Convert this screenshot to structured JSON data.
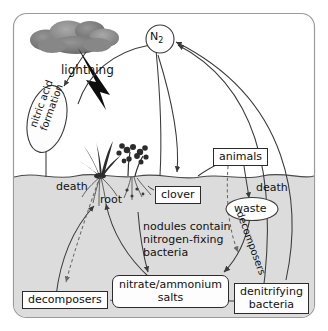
{
  "diagram": {
    "colors": {
      "ink": "#111111",
      "line": "#3a3a3a",
      "soil": "#dcdcdc",
      "cloud_dark": "#6e6e6e",
      "cloud_light": "#9a9a9a",
      "lightning": "#0d0d0d",
      "plant": "#2c2c2c",
      "frame": "#9a9a9a",
      "box_fill": "#fdfdfd"
    },
    "nodes": {
      "n2": {
        "label": "N2",
        "label_text": "N",
        "subscript": "2",
        "shape": "circle"
      },
      "nitric_acid": {
        "label": "nitric acid\nformation",
        "line1": "nitric acid",
        "line2": "formation",
        "shape": "ellipse",
        "rotated": true
      },
      "clover": {
        "label": "clover",
        "shape": "rect"
      },
      "animals": {
        "label": "animals",
        "shape": "rect"
      },
      "waste": {
        "label": "waste",
        "shape": "ellipse"
      },
      "nitrate_salts": {
        "label": "nitrate/ammonium salts",
        "line1": "nitrate/ammonium",
        "line2": "salts",
        "shape": "rounded-rect"
      },
      "decomposers_soil": {
        "label": "decomposers",
        "shape": "rect"
      },
      "denitrifying": {
        "label": "denitrifying bacteria",
        "line1": "denitrifying",
        "line2": "bacteria",
        "shape": "rect"
      }
    },
    "annotations": {
      "lightning": "lightning",
      "death_left": "death",
      "death_right": "death",
      "root": "root",
      "decomposers_curve": "decomposers",
      "nodules": "nodules contain\nnitrogen-fixing\nbacteria",
      "nodules_line1": "nodules contain",
      "nodules_line2": "nitrogen-fixing",
      "nodules_line3": "bacteria"
    }
  }
}
